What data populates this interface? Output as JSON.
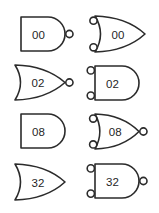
{
  "canvas": {
    "width": 159,
    "height": 213,
    "background_color": "#ffffff",
    "stroke_color": "#2b2b2b",
    "label_color": "#1f1f1f"
  },
  "diagram": {
    "type": "logic-gate-symbol-sheet",
    "columns": 2,
    "rows": 4,
    "gates": [
      {
        "id": "gate-r1c1",
        "label": "00",
        "shape": "and",
        "output_bubble": true,
        "input_bubbles": 0,
        "gate_type": "nand",
        "row": 1,
        "column": 1,
        "x": 21,
        "y": 17,
        "width": 44,
        "height": 34
      },
      {
        "id": "gate-r1c2",
        "label": "00",
        "shape": "or",
        "output_bubble": false,
        "input_bubbles": 2,
        "gate_type": "or-with-inverted-inputs",
        "row": 1,
        "column": 2,
        "x": 95,
        "y": 16,
        "width": 50,
        "height": 36
      },
      {
        "id": "gate-r2c1",
        "label": "02",
        "shape": "or",
        "output_bubble": true,
        "input_bubbles": 0,
        "gate_type": "nor",
        "row": 2,
        "column": 1,
        "x": 15,
        "y": 65,
        "width": 50,
        "height": 35
      },
      {
        "id": "gate-r2c2",
        "label": "02",
        "shape": "and",
        "output_bubble": false,
        "input_bubbles": 2,
        "gate_type": "and-with-inverted-inputs",
        "row": 2,
        "column": 2,
        "x": 95,
        "y": 66,
        "width": 44,
        "height": 34
      },
      {
        "id": "gate-r3c1",
        "label": "08",
        "shape": "and",
        "output_bubble": false,
        "input_bubbles": 0,
        "gate_type": "and",
        "row": 3,
        "column": 1,
        "x": 21,
        "y": 114,
        "width": 44,
        "height": 34
      },
      {
        "id": "gate-r3c2",
        "label": "08",
        "shape": "or",
        "output_bubble": true,
        "input_bubbles": 2,
        "gate_type": "nor-with-inverted-inputs",
        "row": 3,
        "column": 2,
        "x": 95,
        "y": 114,
        "width": 44,
        "height": 35
      },
      {
        "id": "gate-r4c1",
        "label": "32",
        "shape": "or",
        "output_bubble": false,
        "input_bubbles": 0,
        "gate_type": "or",
        "row": 4,
        "column": 1,
        "x": 15,
        "y": 164,
        "width": 50,
        "height": 36
      },
      {
        "id": "gate-r4c2",
        "label": "32",
        "shape": "and",
        "output_bubble": true,
        "input_bubbles": 2,
        "gate_type": "nand-with-inverted-inputs",
        "row": 4,
        "column": 2,
        "x": 95,
        "y": 164,
        "width": 44,
        "height": 34
      }
    ]
  }
}
